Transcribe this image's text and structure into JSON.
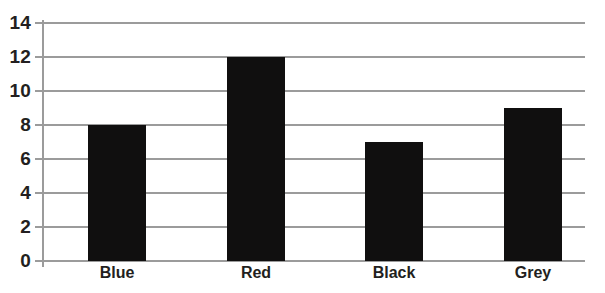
{
  "chart_data": {
    "type": "bar",
    "title": "",
    "subtitle": "",
    "xlabel": "",
    "ylabel": "",
    "categories": [
      "Blue",
      "Red",
      "Black",
      "Grey"
    ],
    "values": [
      8,
      12,
      7,
      9
    ],
    "series": [
      {
        "name": "Count",
        "values": [
          8,
          12,
          7,
          9
        ]
      }
    ],
    "ylim": [
      0,
      14
    ],
    "ytick_step": 2,
    "yticks": [
      0,
      2,
      4,
      6,
      8,
      10,
      12,
      14
    ],
    "ytick_labels": [
      "0",
      "2",
      "4",
      "6",
      "8",
      "10",
      "12",
      "14"
    ],
    "grid": true,
    "grid_axis": "y",
    "legend": false,
    "legend_position": "none",
    "annotations": [],
    "colors": {
      "bar_fill": "#100f0f",
      "grid": "#9b9b9b",
      "axis": "#9b9b9b",
      "tick_label": "#231f20",
      "background": "#ffffff"
    }
  }
}
